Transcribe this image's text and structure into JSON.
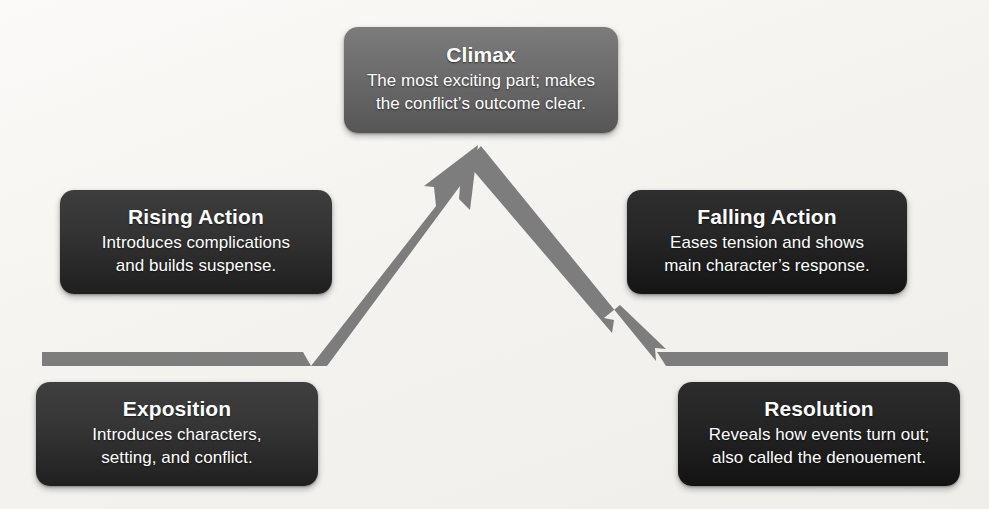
{
  "diagram": {
    "background_color": "#f4f3ef",
    "arrow_color": "#7d7d7d",
    "stages": [
      {
        "id": "exposition",
        "title": "Exposition",
        "description_lines": [
          "Introduces characters,",
          "setting, and conflict."
        ],
        "box_color": "#363636"
      },
      {
        "id": "rising-action",
        "title": "Rising Action",
        "description_lines": [
          "Introduces complications",
          "and builds suspense."
        ],
        "box_color": "#343434"
      },
      {
        "id": "climax",
        "title": "Climax",
        "description_lines": [
          "The most exciting part; makes",
          "the conflict’s outcome clear."
        ],
        "box_color": "#6e6e6e"
      },
      {
        "id": "falling-action",
        "title": "Falling Action",
        "description_lines": [
          "Eases tension and shows",
          "main character’s response."
        ],
        "box_color": "#272727"
      },
      {
        "id": "resolution",
        "title": "Resolution",
        "description_lines": [
          "Reveals how events turn out;",
          "also called the denouement."
        ],
        "box_color": "#252525"
      }
    ]
  }
}
